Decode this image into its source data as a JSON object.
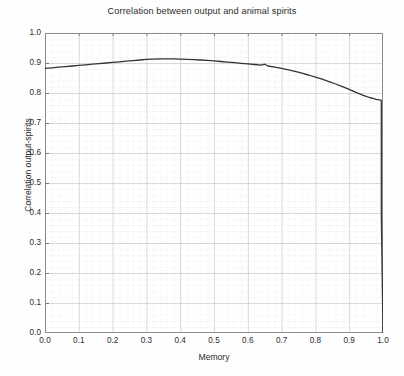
{
  "chart_data": {
    "type": "line",
    "title": "Correlation between output and animal spirits",
    "xlabel": "Memory",
    "ylabel": "Correlation output-spirits",
    "xlim": [
      0.0,
      1.0
    ],
    "ylim": [
      0.0,
      1.0
    ],
    "xticks": [
      "0.0",
      "0.1",
      "0.2",
      "0.3",
      "0.4",
      "0.5",
      "0.6",
      "0.7",
      "0.8",
      "0.9",
      "1.0"
    ],
    "xtick_values": [
      0.0,
      0.1,
      0.2,
      0.3,
      0.4,
      0.5,
      0.6,
      0.7,
      0.8,
      0.9,
      1.0
    ],
    "yticks": [
      "0.0",
      "0.1",
      "0.2",
      "0.3",
      "0.4",
      "0.5",
      "0.6",
      "0.7",
      "0.8",
      "0.9",
      "1.0"
    ],
    "ytick_values": [
      0.0,
      0.1,
      0.2,
      0.3,
      0.4,
      0.5,
      0.6,
      0.7,
      0.8,
      0.9,
      1.0
    ],
    "grid": true,
    "minor_grid": true,
    "legend": null,
    "line_color": "#333333",
    "grid_color": "#c9c9c9",
    "minor_grid_color": "#dedede",
    "axis_color": "#8a8a8a",
    "series": [
      {
        "name": "Correlation output-spirits",
        "x": [
          0.0,
          0.02,
          0.04,
          0.06,
          0.08,
          0.1,
          0.12,
          0.14,
          0.16,
          0.18,
          0.2,
          0.22,
          0.24,
          0.26,
          0.28,
          0.3,
          0.32,
          0.34,
          0.36,
          0.38,
          0.4,
          0.42,
          0.44,
          0.46,
          0.48,
          0.5,
          0.52,
          0.54,
          0.56,
          0.58,
          0.6,
          0.62,
          0.64,
          0.65,
          0.66,
          0.68,
          0.7,
          0.72,
          0.74,
          0.76,
          0.78,
          0.8,
          0.82,
          0.84,
          0.86,
          0.88,
          0.9,
          0.92,
          0.94,
          0.95,
          0.96,
          0.97,
          0.98,
          0.985,
          0.99,
          0.993,
          0.995,
          0.995,
          1.0
        ],
        "y": [
          0.882,
          0.884,
          0.886,
          0.888,
          0.89,
          0.892,
          0.894,
          0.896,
          0.898,
          0.9,
          0.902,
          0.904,
          0.906,
          0.908,
          0.91,
          0.912,
          0.913,
          0.914,
          0.914,
          0.914,
          0.913,
          0.912,
          0.911,
          0.91,
          0.909,
          0.907,
          0.905,
          0.903,
          0.901,
          0.899,
          0.897,
          0.895,
          0.893,
          0.896,
          0.89,
          0.886,
          0.882,
          0.877,
          0.872,
          0.866,
          0.86,
          0.853,
          0.846,
          0.838,
          0.83,
          0.821,
          0.812,
          0.802,
          0.793,
          0.789,
          0.785,
          0.782,
          0.779,
          0.778,
          0.777,
          0.776,
          0.775,
          0.4,
          0.0
        ]
      }
    ],
    "annotations": [
      {
        "text": "vertical drop to zero at memory = 1.0",
        "x": 0.995,
        "y": 0.775
      }
    ]
  },
  "caption": {
    "text": "",
    "visible": false
  }
}
